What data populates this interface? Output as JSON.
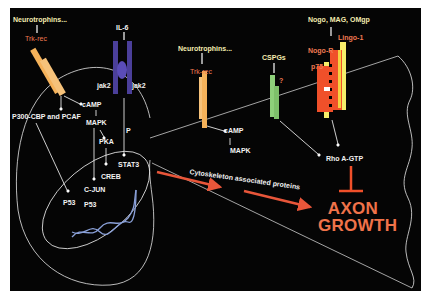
{
  "colors": {
    "background": "#050505",
    "frame": "#ffffff",
    "label_white": "#f2f2f2",
    "label_yellow": "#f4ecb0",
    "label_orange": "#f07a52",
    "trk_receptor": "#f5b25a",
    "il6_receptor": "#4b3f9a",
    "cspg_receptor": "#8ed07a",
    "nogo_receptor": "#f0502a",
    "lingo_receptor": "#f6ee6a",
    "arrow_red": "#e8563a",
    "dna": "#8aa0d8"
  },
  "cell_body": {
    "ligands": {
      "neurotrophins": "Neurotrophins...",
      "il6": "IL-6"
    },
    "receptors": {
      "trk": "Trk-rec",
      "jak_left": "jak2",
      "jak_right": "jak2"
    },
    "signaling": {
      "camp": "cAMP",
      "mapk": "MAPK",
      "pka": "PKA",
      "p300": "P300-CBP and PCAF",
      "p": "P",
      "stat3": "STAT3",
      "creb": "CREB",
      "cjun": "C-JUN",
      "p53_left": "P53",
      "p53_center": "P53"
    }
  },
  "growth_cone": {
    "ligands": {
      "neurotrophins": "Neurotrophins...",
      "cspgs": "CSPGs",
      "myelin": "Nogo, MAG, OMgp"
    },
    "receptors": {
      "trk": "Trk-rec",
      "unknown": "?",
      "lingo": "Lingo-1",
      "nogo": "Nogo-R",
      "p75": "p75"
    },
    "signaling": {
      "camp": "cAMP",
      "mapk": "MAPK",
      "rho": "Rho A-GTP"
    }
  },
  "transport": {
    "label": "Cytoskeleton associated proteins"
  },
  "outcome": {
    "line1": "AXON",
    "line2": "GROWTH"
  }
}
